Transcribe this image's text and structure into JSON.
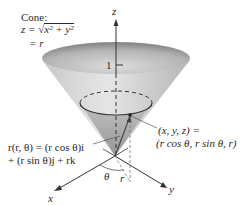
{
  "figure": {
    "cone_label": {
      "title": "Cone:",
      "equation_lhs": "z = ",
      "radical_symbol": "√",
      "radicand": "x² + y²",
      "equation_line2": "= r"
    },
    "axes": {
      "x_label": "x",
      "y_label": "y",
      "z_label": "z",
      "z_tick_label": "1"
    },
    "point_label": {
      "line1": "(x, y, z) =",
      "line2": "(r cos θ, r sin θ, r)"
    },
    "vector_label": {
      "line1": "r(r, θ) = (r cos θ)i",
      "line2": "+ (r sin θ)j + rk"
    },
    "angle_label": "θ",
    "radius_label": "r",
    "colors": {
      "cone_fill_light": "#e4e4e4",
      "cone_fill_dark": "#9a9a9a",
      "axis_line": "#333333",
      "text": "#2a2a2a"
    }
  }
}
